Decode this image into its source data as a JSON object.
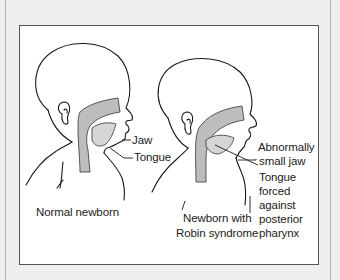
{
  "figure": {
    "background": "#efefef",
    "panel_border": "#555555",
    "shade_color": "#b9b9b9",
    "left_figure": {
      "caption": "Normal newborn",
      "callouts": {
        "jaw": "Jaw",
        "tongue": "Tongue"
      }
    },
    "right_figure": {
      "caption_line1": "Newborn with",
      "caption_line2": "Robin syndrome",
      "callouts": {
        "abnormal_line1": "Abnormally",
        "abnormal_line2": "small jaw",
        "tongue_line1": "Tongue",
        "tongue_line2": "forced",
        "tongue_line3": "against",
        "tongue_line4": "posterior",
        "tongue_line5": "pharynx"
      }
    }
  }
}
